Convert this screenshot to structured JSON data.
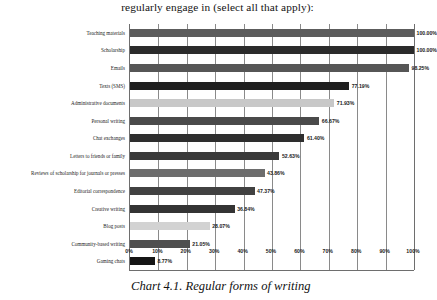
{
  "chart_data": {
    "type": "bar",
    "orientation": "horizontal",
    "title": "regularly engage in (select all that apply):",
    "caption": "Chart 4.1. Regular forms of writing",
    "xlabel": "",
    "ylabel": "",
    "xlim": [
      0,
      100
    ],
    "grid": true,
    "legend": "none",
    "categories": [
      "Teaching materials",
      "Scholarship",
      "Emails",
      "Texts (SMS)",
      "Administrative documents",
      "Personal writing",
      "Chat exchanges",
      "Letters to friends or family",
      "Reviews of scholarship for journals or presses",
      "Editorial correspondence",
      "Creative writing",
      "Blog posts",
      "Community-based writing",
      "Gaming chats"
    ],
    "values": [
      100.0,
      100.0,
      98.25,
      77.19,
      71.93,
      66.67,
      61.4,
      52.63,
      47.37,
      43.86,
      36.84,
      28.07,
      21.05,
      8.77
    ],
    "value_labels": [
      "100.00%",
      "100.00%",
      "98.25%",
      "77.19%",
      "71.93%",
      "66.67%",
      "61.40%",
      "52.63%",
      "43.86%",
      "47.37%",
      "36.84%",
      "28.07%",
      "21.05%",
      "8.77%"
    ],
    "bar_colors": [
      "#5c5c5c",
      "#2b2b2b",
      "#565656",
      "#1f1f1f",
      "#c8c8c8",
      "#4a4a4a",
      "#2e2e2e",
      "#3a3a3a",
      "#6d6d6d",
      "#414141",
      "#343434",
      "#d2d2d2",
      "#4f4f4f",
      "#151515"
    ],
    "xticks": [
      "0%",
      "10%",
      "20%",
      "30%",
      "40%",
      "50%",
      "60%",
      "70%",
      "80%",
      "90%",
      "100%"
    ],
    "xtick_values": [
      0,
      10,
      20,
      30,
      40,
      50,
      60,
      70,
      80,
      90,
      100
    ]
  },
  "colors": {
    "axis": "#6e6e6e",
    "gridline": "#8a8a8a",
    "text": "#1a1a1a",
    "background": "#ffffff"
  }
}
